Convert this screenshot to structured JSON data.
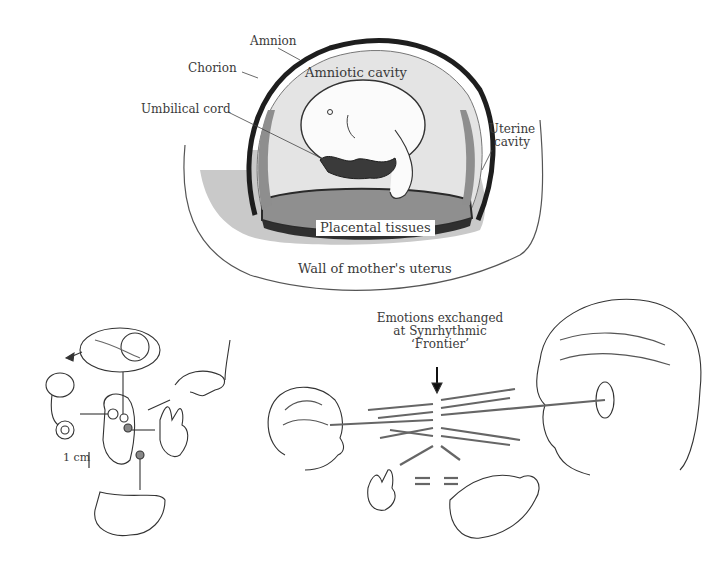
{
  "diagram": {
    "top_panel": {
      "title": "Embryo in uterus",
      "labels": {
        "amnion": "Amnion",
        "chorion": "Chorion",
        "umbilical_cord": "Umbilical cord",
        "amniotic_cavity": "Amniotic cavity",
        "uterine_cavity_line1": "Uterine",
        "uterine_cavity_line2": "cavity",
        "placental_tissues": "Placental tissues",
        "wall_of_uterus": "Wall of mother's uterus"
      }
    },
    "bottom_left_panel": {
      "title": "Embryo sense organs",
      "scale_label": "1 cm"
    },
    "bottom_right_panel": {
      "title": "Mother-infant communication",
      "caption_line1": "Emotions exchanged",
      "caption_line2": "at Synrhythmic",
      "caption_line3": "‘Frontier’"
    },
    "colors": {
      "ink": "#2a2a2a",
      "amnion_fill": "#e6e6e6",
      "placenta_fill": "#9a9a9a",
      "tissue_fill": "#c8c8c8",
      "dark_band": "#333333"
    }
  }
}
